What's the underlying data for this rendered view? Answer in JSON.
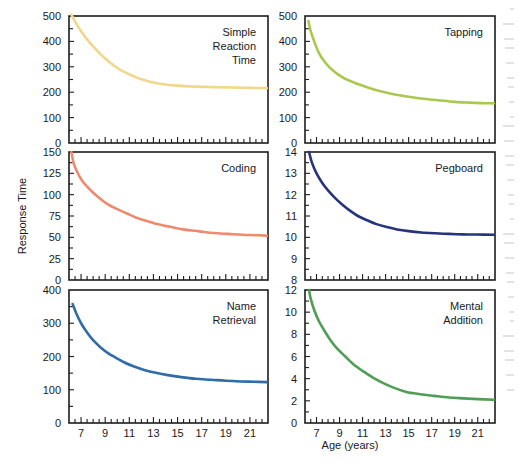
{
  "figure": {
    "y_axis_label": "Response Time",
    "x_axis_label": "Age (years)",
    "background": "#ffffff",
    "frame_color": "#1d1d1d"
  },
  "chart_data": [
    {
      "type": "line",
      "title": "Simple Reaction Time",
      "title_lines": [
        "Simple",
        "Reaction",
        "Time"
      ],
      "color": "#f0d78c",
      "xlabel": "Age (years)",
      "ylabel": "Response Time",
      "xlim": [
        6,
        22.5
      ],
      "ylim": [
        0,
        500
      ],
      "xticks": [
        7,
        9,
        11,
        13,
        15,
        17,
        19,
        21
      ],
      "xtick_labels": [
        "",
        "",
        "",
        "",
        "",
        "",
        "",
        ""
      ],
      "yticks": [
        0,
        100,
        200,
        300,
        400,
        500
      ],
      "ytick_labels": [
        "0",
        "100",
        "200",
        "300",
        "400",
        "500"
      ],
      "x": [
        6.2,
        6.6,
        7,
        7.5,
        8,
        8.5,
        9,
        9.5,
        10,
        10.5,
        11,
        11.5,
        12,
        12.5,
        13,
        14,
        15,
        16,
        17,
        18,
        19,
        20,
        21,
        22.4
      ],
      "y": [
        505,
        470,
        440,
        408,
        380,
        355,
        333,
        313,
        296,
        282,
        270,
        260,
        251,
        244,
        238,
        230,
        226,
        223,
        221,
        220,
        219,
        218,
        217,
        216
      ],
      "grid": false
    },
    {
      "type": "line",
      "title": "Tapping",
      "title_lines": [
        "Tapping"
      ],
      "color": "#aac84e",
      "xlabel": "Age (years)",
      "ylabel": "Response Time",
      "xlim": [
        6,
        22.5
      ],
      "ylim": [
        0,
        500
      ],
      "xticks": [
        7,
        9,
        11,
        13,
        15,
        17,
        19,
        21
      ],
      "xtick_labels": [
        "",
        "",
        "",
        "",
        "",
        "",
        "",
        ""
      ],
      "yticks": [
        0,
        100,
        200,
        300,
        400,
        500
      ],
      "ytick_labels": [
        "0",
        "100",
        "200",
        "300",
        "400",
        "500"
      ],
      "x": [
        6.3,
        6.5,
        6.8,
        7.2,
        7.7,
        8.2,
        8.8,
        9.4,
        10,
        10.7,
        11.5,
        12.3,
        13.2,
        14.2,
        15.3,
        16.5,
        17.8,
        19,
        20.2,
        21.3,
        22.4
      ],
      "y": [
        480,
        440,
        400,
        355,
        320,
        295,
        272,
        255,
        243,
        230,
        218,
        207,
        197,
        188,
        180,
        173,
        167,
        162,
        159,
        157,
        156
      ],
      "grid": false
    },
    {
      "type": "line",
      "title": "Coding",
      "title_lines": [
        "Coding"
      ],
      "color": "#ef8a6e",
      "xlabel": "Age (years)",
      "ylabel": "Response Time",
      "xlim": [
        6,
        22.5
      ],
      "ylim": [
        0,
        150
      ],
      "xticks": [
        7,
        9,
        11,
        13,
        15,
        17,
        19,
        21
      ],
      "xtick_labels": [
        "",
        "",
        "",
        "",
        "",
        "",
        "",
        ""
      ],
      "yticks": [
        0,
        25,
        50,
        75,
        100,
        125,
        150
      ],
      "ytick_labels": [
        "0",
        "25",
        "50",
        "75",
        "100",
        "125",
        "150"
      ],
      "x": [
        6.2,
        6.4,
        6.7,
        7.1,
        7.6,
        8.1,
        8.7,
        9.3,
        10,
        10.8,
        11.6,
        12.5,
        13.5,
        14.5,
        15.6,
        16.8,
        18,
        19.2,
        20.4,
        21.5,
        22.4
      ],
      "y": [
        150,
        136,
        126,
        116,
        108,
        101,
        94,
        88,
        83,
        78,
        73,
        69,
        65,
        62,
        59,
        57,
        55,
        54,
        53,
        52.5,
        52
      ],
      "grid": false
    },
    {
      "type": "line",
      "title": "Pegboard",
      "title_lines": [
        "Pegboard"
      ],
      "color": "#27347a",
      "xlabel": "Age (years)",
      "ylabel": "Response Time",
      "xlim": [
        6,
        22.5
      ],
      "ylim": [
        8,
        14
      ],
      "xticks": [
        7,
        9,
        11,
        13,
        15,
        17,
        19,
        21
      ],
      "xtick_labels": [
        "",
        "",
        "",
        "",
        "",
        "",
        "",
        ""
      ],
      "yticks": [
        8,
        9,
        10,
        11,
        12,
        13,
        14
      ],
      "ytick_labels": [
        "8",
        "9",
        "10",
        "11",
        "12",
        "13",
        "14"
      ],
      "x": [
        6.35,
        6.6,
        7,
        7.5,
        8,
        8.6,
        9.2,
        9.9,
        10.6,
        11.4,
        12.2,
        13.1,
        14,
        15,
        16.1,
        17.3,
        18.5,
        19.7,
        20.9,
        22.4
      ],
      "y": [
        14.0,
        13.5,
        13.0,
        12.55,
        12.2,
        11.85,
        11.55,
        11.25,
        11.0,
        10.8,
        10.62,
        10.48,
        10.37,
        10.29,
        10.23,
        10.19,
        10.16,
        10.14,
        10.13,
        10.12
      ],
      "grid": false
    },
    {
      "type": "line",
      "title": "Name Retrieval",
      "title_lines": [
        "Name",
        "Retrieval"
      ],
      "color": "#2f6ca8",
      "xlabel": "Age (years)",
      "ylabel": "Response Time",
      "xlim": [
        6,
        22.5
      ],
      "ylim": [
        0,
        400
      ],
      "xticks": [
        7,
        9,
        11,
        13,
        15,
        17,
        19,
        21
      ],
      "xtick_labels": [
        "7",
        "9",
        "11",
        "13",
        "15",
        "17",
        "19",
        "21"
      ],
      "yticks": [
        0,
        100,
        200,
        300,
        400
      ],
      "ytick_labels": [
        "0",
        "100",
        "200",
        "300",
        "400"
      ],
      "x": [
        6.3,
        6.6,
        7,
        7.5,
        8,
        8.6,
        9.2,
        9.9,
        10.6,
        11.4,
        12.3,
        13.2,
        14.2,
        15.3,
        16.5,
        17.8,
        19,
        20.2,
        21.3,
        22.4
      ],
      "y": [
        358,
        330,
        300,
        272,
        249,
        228,
        211,
        196,
        182,
        170,
        159,
        151,
        144,
        138,
        133,
        130,
        127,
        125,
        124,
        123
      ],
      "grid": false
    },
    {
      "type": "line",
      "title": "Mental Addition",
      "title_lines": [
        "Mental",
        "Addition"
      ],
      "color": "#4f9e55",
      "xlabel": "Age (years)",
      "ylabel": "Response Time",
      "xlim": [
        6,
        22.5
      ],
      "ylim": [
        0,
        12
      ],
      "xticks": [
        7,
        9,
        11,
        13,
        15,
        17,
        19,
        21
      ],
      "xtick_labels": [
        "7",
        "9",
        "11",
        "13",
        "15",
        "17",
        "19",
        "21"
      ],
      "yticks": [
        0,
        2,
        4,
        6,
        8,
        10,
        12
      ],
      "ytick_labels": [
        "0",
        "2",
        "4",
        "6",
        "8",
        "10",
        "12"
      ],
      "x": [
        6.35,
        6.5,
        6.8,
        7.2,
        7.7,
        8.2,
        8.8,
        9.5,
        10.2,
        11,
        11.9,
        12.8,
        13.8,
        14.8,
        16,
        17.2,
        18.5,
        19.8,
        21,
        22.4
      ],
      "y": [
        12.0,
        11.2,
        10.2,
        9.2,
        8.3,
        7.5,
        6.7,
        6.0,
        5.3,
        4.7,
        4.1,
        3.6,
        3.15,
        2.8,
        2.6,
        2.45,
        2.3,
        2.22,
        2.15,
        2.1
      ],
      "grid": false
    }
  ]
}
